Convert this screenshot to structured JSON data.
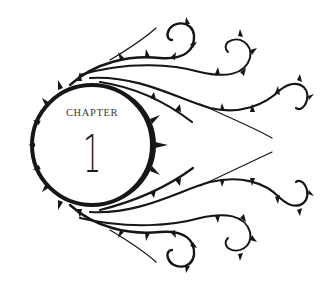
{
  "heading": {
    "label": "CHAPTER",
    "number": "1"
  },
  "colors": {
    "ink": "#161616",
    "background": "#ffffff",
    "label_text": "#3a3a3a"
  },
  "ornament": {
    "type": "thorny-vine-circle",
    "description": "Circular thorned wreath with thorny vines sweeping right into curls"
  }
}
